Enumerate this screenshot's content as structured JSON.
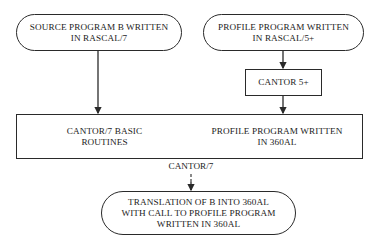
{
  "diagram": {
    "nodes": {
      "source_program": {
        "line1": "SOURCE PROGRAM B WRITTEN",
        "line2": "IN RASCAL/7",
        "shape": "terminal"
      },
      "profile_program_rascal": {
        "line1": "PROFILE PROGRAM WRITTEN",
        "line2": "IN RASCAL/5+",
        "shape": "terminal"
      },
      "cantor5": {
        "line1": "CANTOR 5+",
        "shape": "process"
      },
      "cantor7_basic": {
        "line1": "CANTOR/7 BASIC",
        "line2": "ROUTINES",
        "shape": "process"
      },
      "profile_program_360al": {
        "line1": "PROFILE PROGRAM WRITTEN",
        "line2": "IN 360AL",
        "shape": "process"
      },
      "translation": {
        "line1": "TRANSLATION OF B INTO 360AL",
        "line2": "WITH CALL TO PROFILE PROGRAM",
        "line3": "WRITTEN IN 360AL",
        "shape": "terminal"
      }
    },
    "edge_labels": {
      "cantor7": "CANTOR/7"
    },
    "edges": [
      {
        "from": "source_program",
        "to": "cantor7_basic"
      },
      {
        "from": "profile_program_rascal",
        "to": "cantor5"
      },
      {
        "from": "cantor5",
        "to": "profile_program_360al"
      },
      {
        "from": "cantor7_basic + profile_program_360al",
        "to": "translation",
        "label": "CANTOR/7"
      }
    ],
    "colors": {
      "line": "#2a2a2a",
      "text": "#1c1c1c",
      "background": "#ffffff"
    }
  }
}
